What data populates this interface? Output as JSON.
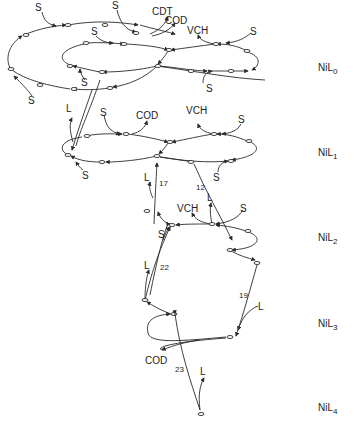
{
  "diagram": {
    "type": "catalytic cycle / reaction network",
    "levels": [
      {
        "id": "NiL0",
        "base": "NiL",
        "sub": "0",
        "y": 72
      },
      {
        "id": "NiL1",
        "base": "NiL",
        "sub": "1",
        "y": 157
      },
      {
        "id": "NiL2",
        "base": "NiL",
        "sub": "2",
        "y": 242
      },
      {
        "id": "NiL3",
        "base": "NiL",
        "sub": "3",
        "y": 328
      },
      {
        "id": "NiL4",
        "base": "NiL",
        "sub": "4",
        "y": 412
      }
    ],
    "labels": {
      "s": "S",
      "l": "L",
      "cdt": "CDT",
      "cod": "COD",
      "vch": "VCH"
    },
    "edge_numbers": {
      "n12": "12",
      "n17": "17",
      "n22": "22",
      "n19": "19",
      "n23": "23"
    },
    "colors": {
      "line": "#2a2a2a",
      "background": "#ffffff"
    }
  }
}
